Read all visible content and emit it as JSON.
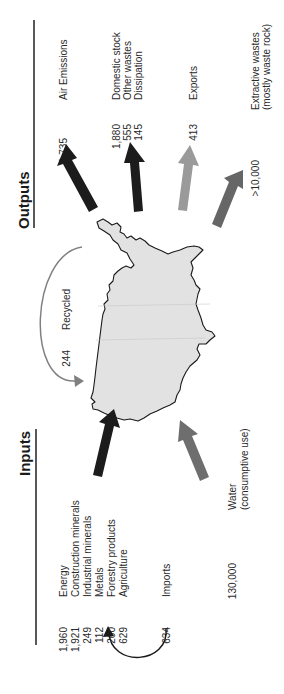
{
  "headings": {
    "inputs": "Inputs",
    "outputs": "Outputs"
  },
  "inputs": {
    "materials": [
      {
        "value": "1,960",
        "label": "Energy"
      },
      {
        "value": "1,921",
        "label": "Construction minerals"
      },
      {
        "value": "249",
        "label": "Industrial minerals"
      },
      {
        "value": "112",
        "label": "Metals"
      },
      {
        "value": "260",
        "label": "Forestry products"
      },
      {
        "value": "629",
        "label": "Agriculture"
      }
    ],
    "imports": {
      "value": "634",
      "label": "Imports"
    },
    "water": {
      "value": "130,000",
      "label": "Water",
      "sublabel": "(consumptive use)"
    }
  },
  "recycled": {
    "value": "244",
    "label": "Recycled"
  },
  "outputs": {
    "air": {
      "value": "1,735",
      "label": "Air Emissions"
    },
    "domestic": [
      {
        "value": "1,880",
        "label": "Domestic stock"
      },
      {
        "value": "555",
        "label": "Other wastes"
      },
      {
        "value": "145",
        "label": "Dissipation"
      }
    ],
    "exports": {
      "value": "413",
      "label": "Exports"
    },
    "extractive": {
      "value": ">10,000",
      "label": "Extractive wastes",
      "sublabel": "(mostly waste rock)"
    }
  },
  "colors": {
    "arrow_dark": "#1c1c1c",
    "arrow_light": "#9a9a9a",
    "arrow_medium": "#666666",
    "arrow_water": "#6e6e6e",
    "recycle_arc": "#808080",
    "map_fill": "#e2e2e2",
    "map_stroke": "#1a1a1a"
  }
}
